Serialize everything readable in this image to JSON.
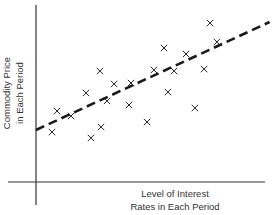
{
  "chart_data": {
    "type": "scatter",
    "title": "",
    "xlabel": "Level of Interest Rates in Each Period",
    "ylabel": "Commodity Price in Each Period",
    "xlabel_lines": [
      "Level of Interest",
      "Rates in Each Period"
    ],
    "ylabel_lines": [
      "Commodity Price",
      "in Each Period"
    ],
    "xlim": [
      0,
      100
    ],
    "ylim": [
      0,
      100
    ],
    "grid": false,
    "legend": null,
    "ticks": "none",
    "marker": "x",
    "series": [
      {
        "name": "observations",
        "points": [
          {
            "x": 7.0,
            "y": 28.2
          },
          {
            "x": 9.2,
            "y": 40.1
          },
          {
            "x": 15.3,
            "y": 37.3
          },
          {
            "x": 21.8,
            "y": 50.3
          },
          {
            "x": 24.0,
            "y": 24.9
          },
          {
            "x": 27.9,
            "y": 62.7
          },
          {
            "x": 28.4,
            "y": 31.1
          },
          {
            "x": 31.0,
            "y": 45.8
          },
          {
            "x": 34.1,
            "y": 55.4
          },
          {
            "x": 40.6,
            "y": 43.5
          },
          {
            "x": 41.5,
            "y": 55.9
          },
          {
            "x": 48.5,
            "y": 33.9
          },
          {
            "x": 51.5,
            "y": 63.3
          },
          {
            "x": 55.9,
            "y": 75.7
          },
          {
            "x": 57.6,
            "y": 50.8
          },
          {
            "x": 60.3,
            "y": 62.7
          },
          {
            "x": 65.5,
            "y": 72.3
          },
          {
            "x": 69.4,
            "y": 41.8
          },
          {
            "x": 73.4,
            "y": 63.8
          },
          {
            "x": 76.0,
            "y": 89.8
          },
          {
            "x": 79.0,
            "y": 79.1
          }
        ]
      }
    ],
    "trend_line": {
      "style": "dashed",
      "start": {
        "x": 0,
        "y": 29.4
      },
      "end": {
        "x": 102,
        "y": 90.4
      }
    }
  },
  "colors": {
    "ink": "#222222",
    "background": "#ffffff"
  }
}
